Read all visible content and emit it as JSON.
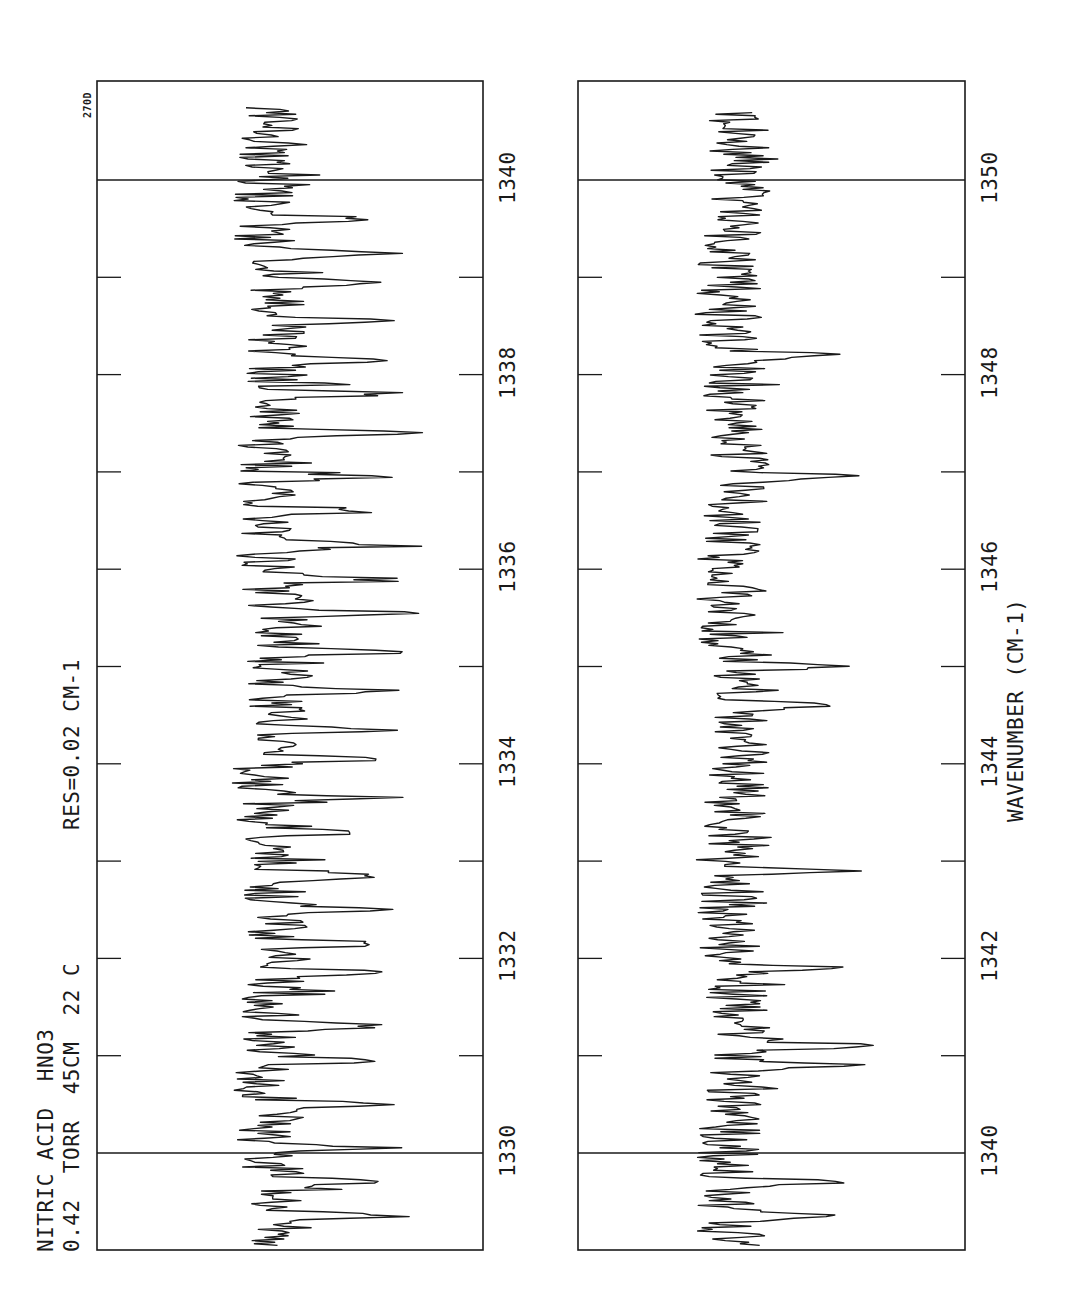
{
  "header": {
    "line1": "NITRIC ACID  HNO3",
    "line2": "0.42  TORR  45CM  22 C",
    "resolution": "RES=0.02 CM-1",
    "plot_id": "270D"
  },
  "chart_data": [
    {
      "type": "line",
      "title": "NITRIC ACID HNO3 — 0.42 TORR, 45CM, 22 C, RES=0.02 CM-1",
      "panel": "left",
      "orientation": "rotated 90° (wavenumber increases upward on page)",
      "xlabel": "WAVENUMBER (CM-1)",
      "ylabel": "Transmittance (arbitrary, unlabeled)",
      "xlim": [
        1329.0,
        1341.0
      ],
      "data_range": [
        1329.05,
        1340.75
      ],
      "major_ticks": [
        1330,
        1332,
        1334,
        1336,
        1338,
        1340
      ],
      "tick_labels": [
        "1330",
        "1332",
        "1334",
        "1336",
        "1338",
        "1340"
      ],
      "minor_ticks": [
        1331,
        1333,
        1335,
        1337,
        1339
      ],
      "full_lines_at": [
        1330,
        1340
      ],
      "baseline_level": 0.45,
      "notable_absorption_peaks": [
        1329.35,
        1329.7,
        1330.05,
        1330.5,
        1330.95,
        1331.3,
        1331.85,
        1332.15,
        1332.5,
        1332.85,
        1333.3,
        1333.65,
        1334.05,
        1334.35,
        1334.75,
        1335.15,
        1335.55,
        1335.9,
        1336.25,
        1336.6,
        1336.95,
        1337.4,
        1337.8,
        1338.15,
        1338.55,
        1338.95,
        1339.25,
        1339.6
      ],
      "grid": false
    },
    {
      "type": "line",
      "panel": "right",
      "orientation": "rotated 90° (wavenumber increases upward on page)",
      "xlabel": "WAVENUMBER (CM-1)",
      "ylabel": "Transmittance (arbitrary, unlabeled)",
      "xlim": [
        1339.0,
        1351.0
      ],
      "data_range": [
        1339.05,
        1350.7
      ],
      "major_ticks": [
        1340,
        1342,
        1344,
        1346,
        1348,
        1350
      ],
      "tick_labels": [
        "1340",
        "1342",
        "1344",
        "1346",
        "1348",
        "1350"
      ],
      "minor_ticks": [
        1341,
        1343,
        1345,
        1347,
        1349
      ],
      "full_lines_at": [
        1340,
        1350
      ],
      "baseline_level": 0.4,
      "notable_absorption_peaks": [
        1339.35,
        1339.7,
        1340.9,
        1341.1,
        1341.9,
        1342.9,
        1344.6,
        1345.0,
        1346.95,
        1348.2
      ],
      "grid": false
    }
  ],
  "axis": {
    "xlabel": "WAVENUMBER (CM-1)"
  },
  "colors": {
    "ink": "#1a1a1a",
    "background": "#ffffff"
  }
}
